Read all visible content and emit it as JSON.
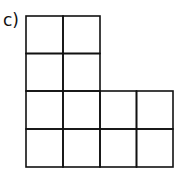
{
  "label": "c)",
  "grid": {
    "unit_squares": 12,
    "layout": "L-shape: 2 columns x 4 rows on the left, plus 2 columns x 2 rows on bottom right",
    "cells": [
      [
        1,
        1,
        0,
        0
      ],
      [
        1,
        1,
        0,
        0
      ],
      [
        1,
        1,
        1,
        1
      ],
      [
        1,
        1,
        1,
        1
      ]
    ],
    "line_color": "#111111"
  }
}
